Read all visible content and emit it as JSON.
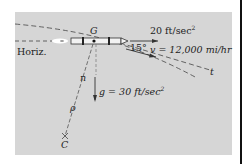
{
  "diagram": {
    "type": "rocket curvilinear motion",
    "labels": {
      "center_of_mass": "G",
      "horizontal": "Horiz.",
      "thrust_accel": "20 ft/sec",
      "thrust_accel_exp": "2",
      "angle": "15°",
      "velocity": "v = 12,000 mi/hr",
      "tangent": "t",
      "normal": "n",
      "radius": "ρ",
      "center_curvature": "C",
      "gravity": "g = 30 ft/sec",
      "gravity_exp": "2"
    },
    "colors": {
      "panel": "#d6d6d6",
      "ink": "#222222",
      "rocket_body": "#f2f2f2"
    }
  }
}
